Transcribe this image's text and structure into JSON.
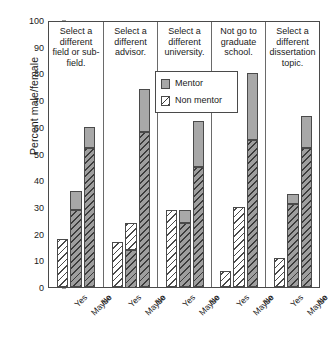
{
  "chart_data": {
    "type": "bar",
    "subtype": "stacked-grouped-panel",
    "title": "",
    "xlabel": "",
    "ylabel": "Percent male/female",
    "ylim": [
      0,
      100
    ],
    "ytick_step": 10,
    "yticks": [
      100,
      90,
      80,
      70,
      60,
      50,
      40,
      30,
      20,
      10,
      0
    ],
    "grid": false,
    "legend_position": "top-center-inside",
    "categories": [
      "Yes",
      "Maybe",
      "No"
    ],
    "series": [
      {
        "name": "Mentor",
        "style": "solid-gray",
        "color": "#a8a8a8"
      },
      {
        "name": "Non mentor",
        "style": "diagonal-hatch",
        "color": "#ffffff"
      }
    ],
    "panels": [
      {
        "title": "Select a different field or sub-field.",
        "bars": [
          {
            "category": "Yes",
            "non_mentor": 18,
            "mentor_top": 18,
            "hatch": "light"
          },
          {
            "category": "Maybe",
            "non_mentor": 29,
            "mentor_top": 36,
            "hatch": "dark"
          },
          {
            "category": "No",
            "non_mentor": 52,
            "mentor_top": 60,
            "hatch": "dark"
          }
        ]
      },
      {
        "title": "Select a different advisor.",
        "bars": [
          {
            "category": "Yes",
            "non_mentor": 17,
            "mentor_top": 17,
            "hatch": "light"
          },
          {
            "category": "Maybe",
            "non_mentor": 24,
            "mentor_top": 24,
            "hatch": "mixed"
          },
          {
            "category": "No",
            "non_mentor": 58,
            "mentor_top": 74,
            "hatch": "dark"
          }
        ]
      },
      {
        "title": "Select a different university.",
        "bars": [
          {
            "category": "Yes",
            "non_mentor": 29,
            "mentor_top": 29,
            "hatch": "light"
          },
          {
            "category": "Maybe",
            "non_mentor": 24,
            "mentor_top": 29,
            "hatch": "dark"
          },
          {
            "category": "No",
            "non_mentor": 45,
            "mentor_top": 62,
            "hatch": "dark"
          }
        ]
      },
      {
        "title": "Not go to graduate school.",
        "bars": [
          {
            "category": "Yes",
            "non_mentor": 6,
            "mentor_top": 6,
            "hatch": "light"
          },
          {
            "category": "Maybe",
            "non_mentor": 30,
            "mentor_top": 30,
            "hatch": "light"
          },
          {
            "category": "No",
            "non_mentor": 55,
            "mentor_top": 80,
            "hatch": "dark"
          }
        ]
      },
      {
        "title": "Select a different dissertation topic.",
        "bars": [
          {
            "category": "Yes",
            "non_mentor": 11,
            "mentor_top": 11,
            "hatch": "light"
          },
          {
            "category": "Maybe",
            "non_mentor": 31,
            "mentor_top": 35,
            "hatch": "dark"
          },
          {
            "category": "No",
            "non_mentor": 52,
            "mentor_top": 64,
            "hatch": "dark"
          }
        ]
      }
    ]
  },
  "legend": {
    "mentor_label": "Mentor",
    "non_mentor_label": "Non mentor"
  }
}
